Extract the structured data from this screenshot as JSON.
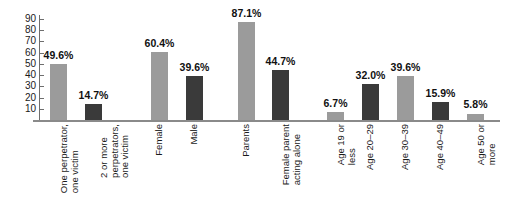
{
  "chart_data": {
    "type": "bar",
    "title": "",
    "subtitle": "",
    "xlabel": "",
    "ylabel": "",
    "ylim": [
      0,
      90
    ],
    "y_ticks": [
      10,
      20,
      30,
      40,
      50,
      60,
      70,
      80,
      90
    ],
    "grid": false,
    "legend": "none",
    "value_suffix": "%",
    "colors": {
      "light_bar": "#9b9b9b",
      "dark_bar": "#3a3a3a",
      "axis": "#6e6e6e",
      "baseline": "#8a8a8a",
      "text": "#1a1a1a"
    },
    "categories": [
      "One perpetrator,\none victim",
      "2 or more\nperpetrators,\none victim",
      "Female",
      "Male",
      "Parents",
      "Female parent\nacting alone",
      "Age 19 or\nless",
      "Age 20–29",
      "Age 30–39",
      "Age 40–49",
      "Age 50 or\nmore"
    ],
    "values": [
      49.6,
      14.7,
      60.4,
      39.6,
      87.1,
      44.7,
      6.7,
      32.0,
      39.6,
      15.9,
      5.8
    ],
    "value_labels": [
      "49.6%",
      "14.7%",
      "60.4%",
      "39.6%",
      "87.1%",
      "44.7%",
      "6.7%",
      "32.0%",
      "39.6%",
      "15.9%",
      "5.8%"
    ],
    "bar_shades": [
      "light",
      "dark",
      "light",
      "dark",
      "light",
      "dark",
      "light",
      "dark",
      "light",
      "dark",
      "light"
    ],
    "bars": [
      {
        "label": "One perpetrator,\none victim",
        "value": 49.6,
        "value_label": "49.6%",
        "shade": "light",
        "x": 50,
        "width": 17
      },
      {
        "label": "2 or more\nperpetrators,\none victim",
        "value": 14.7,
        "value_label": "14.7%",
        "shade": "dark",
        "x": 85,
        "width": 17
      },
      {
        "label": "Female",
        "value": 60.4,
        "value_label": "60.4%",
        "shade": "light",
        "x": 151,
        "width": 17
      },
      {
        "label": "Male",
        "value": 39.6,
        "value_label": "39.6%",
        "shade": "dark",
        "x": 186,
        "width": 17
      },
      {
        "label": "Parents",
        "value": 87.1,
        "value_label": "87.1%",
        "shade": "light",
        "x": 238,
        "width": 17
      },
      {
        "label": "Female parent\nacting alone",
        "value": 44.7,
        "value_label": "44.7%",
        "shade": "dark",
        "x": 272,
        "width": 17
      },
      {
        "label": "Age 19 or\nless",
        "value": 6.7,
        "value_label": "6.7%",
        "shade": "light",
        "x": 327,
        "width": 17
      },
      {
        "label": "Age 20–29",
        "value": 32.0,
        "value_label": "32.0%",
        "shade": "dark",
        "x": 362,
        "width": 17
      },
      {
        "label": "Age 30–39",
        "value": 39.6,
        "value_label": "39.6%",
        "shade": "light",
        "x": 397,
        "width": 17
      },
      {
        "label": "Age 40–49",
        "value": 15.9,
        "value_label": "15.9%",
        "shade": "dark",
        "x": 432,
        "width": 17
      },
      {
        "label": "Age 50 or\nmore",
        "value": 5.8,
        "value_label": "5.8%",
        "shade": "light",
        "x": 467,
        "width": 17
      }
    ],
    "groups": [
      {
        "name": "perpetrator-count",
        "bars": [
          0,
          1
        ]
      },
      {
        "name": "perpetrator-sex",
        "bars": [
          2,
          3
        ]
      },
      {
        "name": "relationship",
        "bars": [
          4,
          5
        ]
      },
      {
        "name": "perpetrator-age",
        "bars": [
          6,
          7,
          8,
          9,
          10
        ]
      }
    ]
  },
  "axis": {
    "y_labels": [
      "90",
      "80",
      "70",
      "60",
      "50",
      "40",
      "30",
      "20",
      "10"
    ]
  }
}
